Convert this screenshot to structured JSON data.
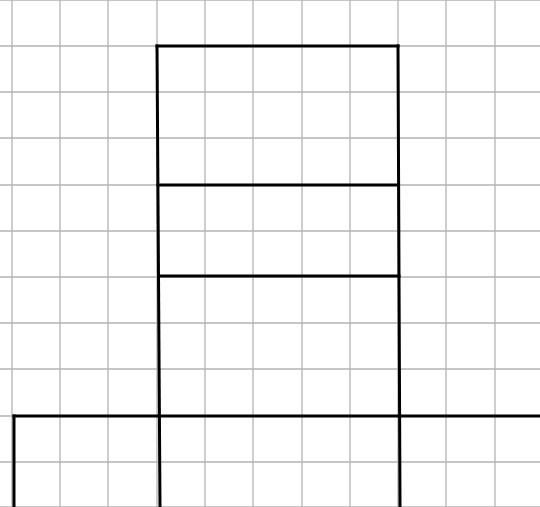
{
  "diagram": {
    "type": "grid-net",
    "grid": {
      "x_lines": [
        12,
        60,
        108,
        157,
        205,
        253,
        302,
        350,
        398,
        446,
        495
      ],
      "y_lines": [
        0,
        46,
        92,
        138,
        185,
        231,
        277,
        323,
        369,
        416,
        462,
        507
      ],
      "color": "#b3b3b3",
      "width": 1.3
    },
    "outline": {
      "color": "#000000",
      "width": 3,
      "segments": [
        {
          "x1": 157,
          "y1": 46,
          "x2": 398,
          "y2": 46
        },
        {
          "x1": 157,
          "y1": 46,
          "x2": 160,
          "y2": 507
        },
        {
          "x1": 398,
          "y1": 46,
          "x2": 400,
          "y2": 507
        },
        {
          "x1": 158,
          "y1": 185,
          "x2": 398,
          "y2": 185
        },
        {
          "x1": 159,
          "y1": 276,
          "x2": 399,
          "y2": 276
        },
        {
          "x1": 14,
          "y1": 416,
          "x2": 540,
          "y2": 416
        },
        {
          "x1": 14,
          "y1": 416,
          "x2": 14,
          "y2": 507
        }
      ]
    }
  }
}
